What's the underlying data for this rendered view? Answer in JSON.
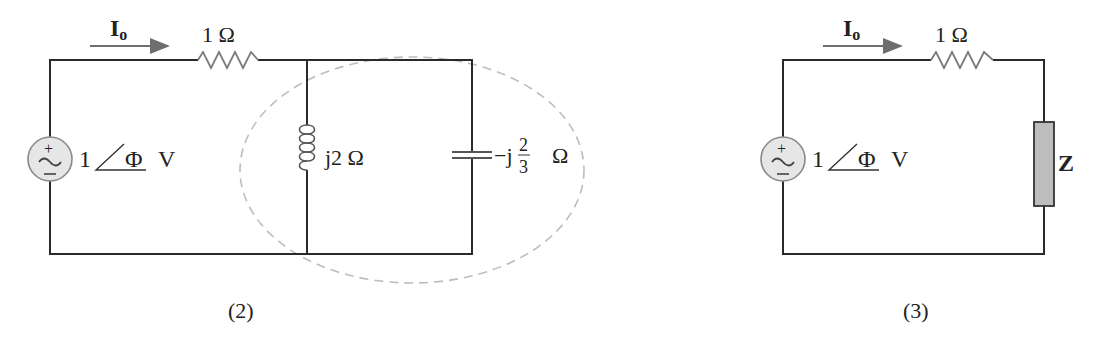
{
  "figures": [
    {
      "id": "2",
      "caption": "(2)",
      "current_label": {
        "main": "I",
        "sub": "o"
      },
      "source": {
        "magnitude": "1",
        "phase": "Φ",
        "unit": "V",
        "plus": "+",
        "minus": "−"
      },
      "resistor": {
        "label": "1 Ω"
      },
      "inductor": {
        "label": "j2 Ω"
      },
      "capacitor": {
        "prefix": "−j",
        "numerator": "2",
        "denominator": "3",
        "unit": "Ω"
      },
      "enclosure": "dashed-ellipse around parallel LC"
    },
    {
      "id": "3",
      "caption": "(3)",
      "current_label": {
        "main": "I",
        "sub": "o"
      },
      "source": {
        "magnitude": "1",
        "phase": "Φ",
        "unit": "V",
        "plus": "+",
        "minus": "−"
      },
      "resistor": {
        "label": "1 Ω"
      },
      "impedance": {
        "label": "Z"
      }
    }
  ],
  "colors": {
    "wire": "#2a2a2a",
    "component": "#7a7a7a",
    "arrow": "#6e6e6e",
    "source_fill": "#e6e6e6",
    "impedance_fill": "#bdbdbd",
    "dashed": "#bdbdbd"
  }
}
